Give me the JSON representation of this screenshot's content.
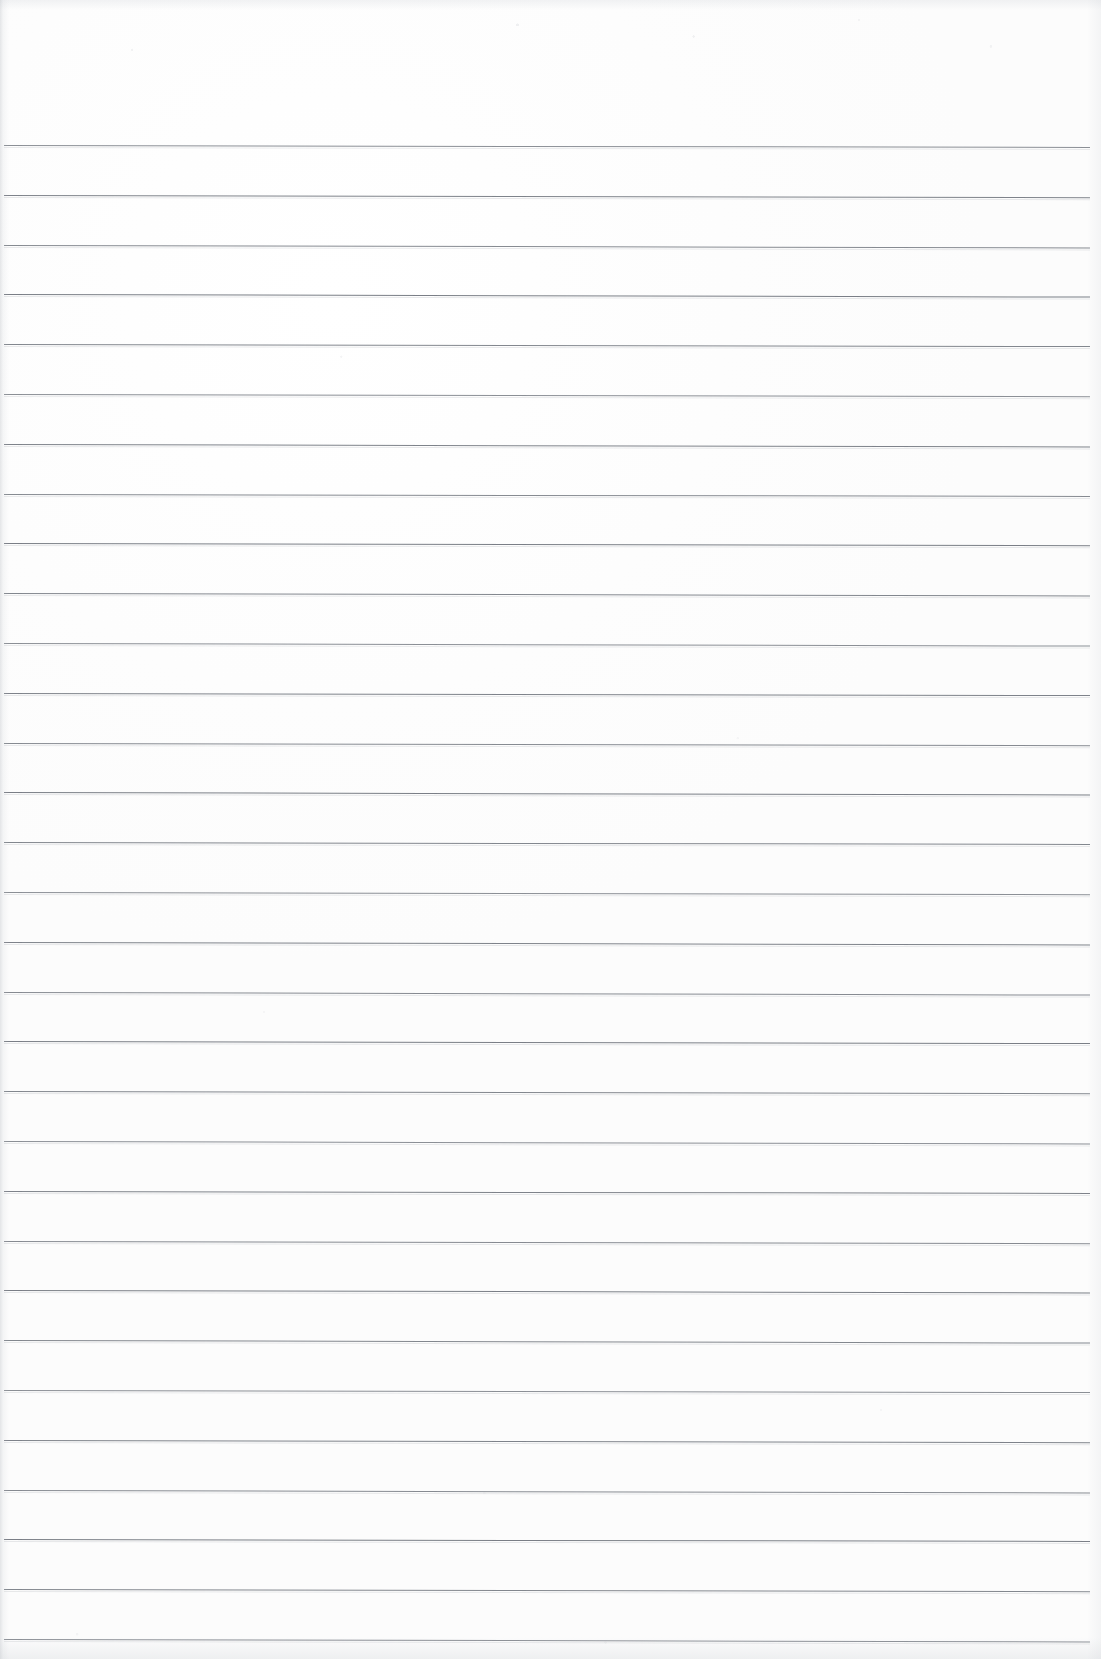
{
  "document": {
    "kind": "scanned-paper",
    "title": "Blank ruled notebook page",
    "content_text": "",
    "page_width": 1101,
    "page_height": 1659,
    "background_color": "#fefefe",
    "rule_color": "#6f747c",
    "handwriting": "none",
    "margin_rule": "none",
    "header_text": "",
    "footer_text": "",
    "page_number": ""
  },
  "ruling": {
    "line_count": 31,
    "first_line_y": 145,
    "spacing": 49.8,
    "left_x": 4,
    "right_x": 1090,
    "tilt_degrees": 0.12,
    "top_margin_height": 145,
    "description": "Evenly spaced horizontal ruled lines spanning nearly the full page width"
  }
}
